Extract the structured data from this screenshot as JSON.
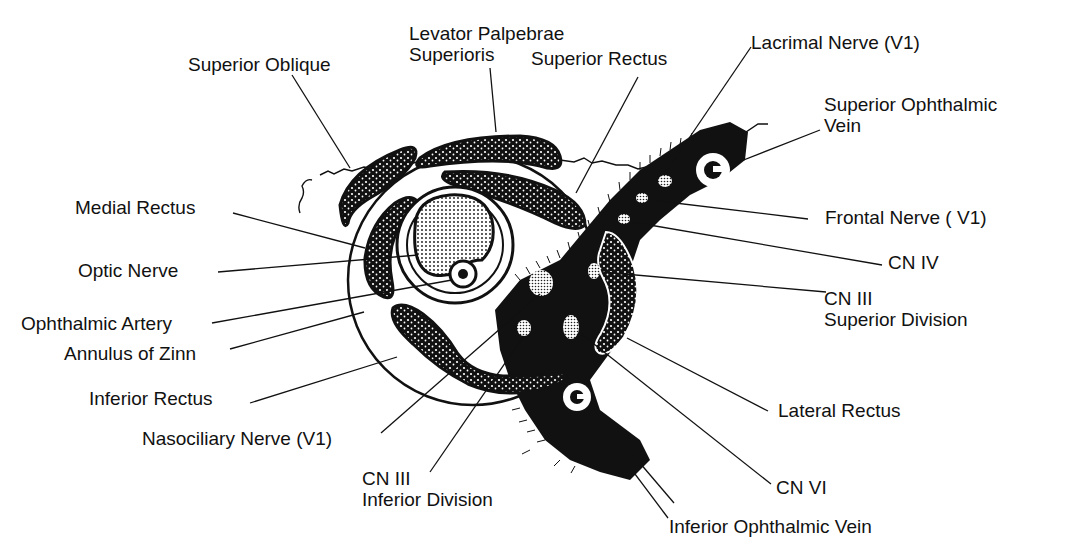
{
  "diagram": {
    "colors": {
      "ink": "#111111",
      "background": "#ffffff"
    },
    "labels": {
      "superior_oblique": "Superior Oblique",
      "levator_line1": "Levator Palpebrae",
      "levator_line2": "Superioris",
      "superior_rectus": "Superior Rectus",
      "lacrimal_nerve": "Lacrimal Nerve (V1)",
      "sup_ophth_vein_line1": "Superior Ophthalmic",
      "sup_ophth_vein_line2": "Vein",
      "medial_rectus": "Medial Rectus",
      "frontal_nerve": "Frontal Nerve ( V1)",
      "optic_nerve": "Optic Nerve",
      "cn_iv": "CN IV",
      "cn_iii_sup_line1": "CN III",
      "cn_iii_sup_line2": "Superior Division",
      "ophthalmic_artery": "Ophthalmic Artery",
      "annulus_of_zinn": "Annulus of Zinn",
      "inferior_rectus": "Inferior Rectus",
      "lateral_rectus": "Lateral Rectus",
      "nasociliary_nerve": "Nasociliary Nerve (V1)",
      "cn_iii_inf_line1": "CN III",
      "cn_iii_inf_line2": "Inferior Division",
      "cn_vi": "CN VI",
      "inf_ophth_vein": "Inferior Ophthalmic Vein"
    }
  }
}
